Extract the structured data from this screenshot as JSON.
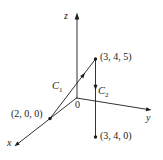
{
  "figure": {
    "background": "#ffffff",
    "ink": "#1c1c1c",
    "axes": {
      "x": "x",
      "y": "y",
      "z": "z"
    },
    "origin": {
      "label": "0"
    },
    "points": [
      {
        "label": "(3, 4, 5)"
      },
      {
        "label": "(2, 0, 0)"
      },
      {
        "label": "(3, 4, 0)"
      }
    ],
    "curves": [
      {
        "letter": "C",
        "sub": "1"
      },
      {
        "letter": "C",
        "sub": "2"
      }
    ]
  }
}
